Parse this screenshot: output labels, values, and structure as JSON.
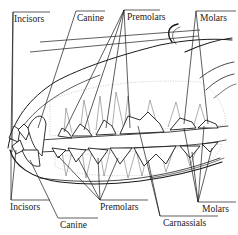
{
  "diagram": {
    "colors": {
      "ink": "#1a1a1a",
      "background": "#ffffff",
      "stipple": "#9a9a9a"
    },
    "labels_top": [
      {
        "id": "incisors",
        "text": "Incisors"
      },
      {
        "id": "canine",
        "text": "Canine"
      },
      {
        "id": "premolars",
        "text": "Premolars"
      },
      {
        "id": "molars",
        "text": "Molars"
      }
    ],
    "labels_bottom": [
      {
        "id": "incisors",
        "text": "Incisors"
      },
      {
        "id": "canine",
        "text": "Canine"
      },
      {
        "id": "premolars",
        "text": "Premolars"
      },
      {
        "id": "carnassials",
        "text": "Carnassials"
      },
      {
        "id": "molars",
        "text": "Molars"
      }
    ]
  }
}
